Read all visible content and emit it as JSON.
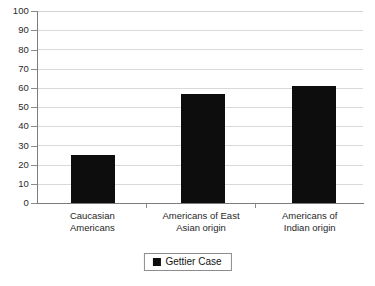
{
  "chart_data": {
    "type": "bar",
    "title": "",
    "subtitle": "",
    "xlabel": "",
    "ylabel": "",
    "ylim": [
      0,
      100
    ],
    "ytick_step": 10,
    "yticks": [
      100,
      90,
      80,
      70,
      60,
      50,
      40,
      30,
      20,
      10,
      0
    ],
    "grid": true,
    "legend_position": "bottom-center",
    "categories": [
      "Caucasian Americans",
      "Americans of East Asian origin",
      "Americans of Indian origin"
    ],
    "category_lines": [
      [
        "Caucasian",
        "Americans"
      ],
      [
        "Americans of East",
        "Asian origin"
      ],
      [
        "Americans of",
        "Indian origin"
      ]
    ],
    "series": [
      {
        "name": "Gettier Case",
        "color": "#0d0d0d",
        "values": [
          25,
          57,
          61
        ]
      }
    ]
  },
  "legend": {
    "items": [
      {
        "label": "Gettier Case",
        "color": "#0d0d0d"
      }
    ]
  },
  "axis": {
    "y_labels": [
      "100",
      "90",
      "80",
      "70",
      "60",
      "50",
      "40",
      "30",
      "20",
      "10",
      "0"
    ]
  },
  "colors": {
    "bar": "#0d0d0d",
    "gridline": "#d9d9d9",
    "axis": "#7c7c7c",
    "background": "#ffffff",
    "text": "#1a1a1a"
  }
}
